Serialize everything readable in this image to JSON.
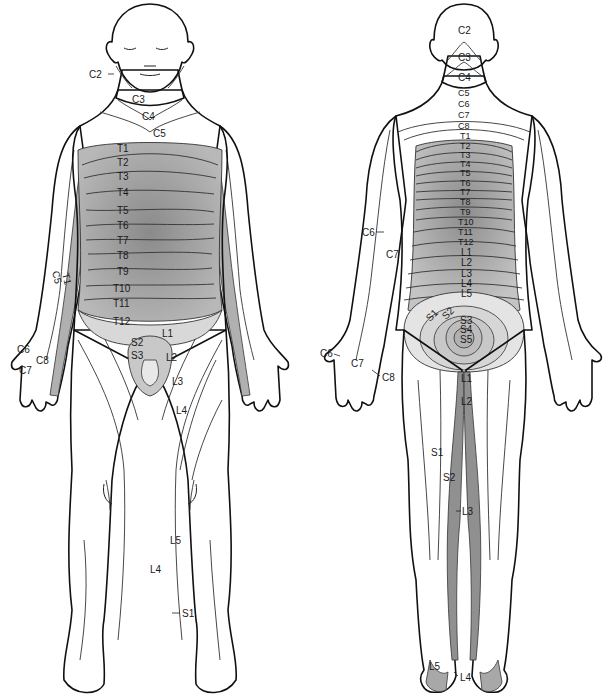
{
  "diagram": {
    "type": "dermatome-map",
    "views": [
      {
        "id": "anterior",
        "labels": {
          "c2": "C2",
          "c3": "C3",
          "c4": "C4",
          "c5": "C5",
          "t1": "T1",
          "t2": "T2",
          "t3": "T3",
          "t4": "T4",
          "t5": "T5",
          "t6": "T6",
          "t7": "T7",
          "t8": "T8",
          "t9": "T9",
          "t10": "T10",
          "t11": "T11",
          "t12": "T12",
          "arm_c5": "C5",
          "arm_t1": "T1",
          "c6": "C6",
          "c7": "C7",
          "c8": "C8",
          "s2": "S2",
          "s3": "S3",
          "l1": "L1",
          "l2": "L2",
          "l3": "L3",
          "l4": "L4",
          "leg_l5": "L5",
          "leg_l4": "L4",
          "s1": "S1"
        }
      },
      {
        "id": "posterior",
        "labels": {
          "c2": "C2",
          "c3": "C3",
          "c4": "C4",
          "c5": "C5",
          "c6": "C6",
          "c7": "C7",
          "c8": "C8",
          "t1": "T1",
          "t2": "T2",
          "t3": "T3",
          "t4": "T4",
          "t5": "T5",
          "t6": "T6",
          "t7": "T7",
          "t8": "T8",
          "t9": "T9",
          "t10": "T10",
          "t11": "T11",
          "t12": "T12",
          "l1": "L1",
          "l2": "L2",
          "l3": "L3",
          "l4": "L4",
          "l5": "L5",
          "s1": "S1",
          "s2": "S2",
          "s3": "S3",
          "s4": "S4",
          "s5": "S5",
          "arm_c6": "C6",
          "arm_c7": "C7",
          "hand_c6": "C6",
          "hand_c7": "C7",
          "hand_c8": "C8",
          "leg_l1": "L1",
          "leg_l2": "L2",
          "leg_s1": "S1",
          "leg_s2": "S2",
          "leg_l3": "L3",
          "foot_l5": "L5",
          "foot_l4": "L4"
        }
      }
    ],
    "colors": {
      "light": "#f2f2f2",
      "mid": "#cfcfcf",
      "dark": "#9a9a9a",
      "darker": "#7f7f7f",
      "outline": "#111111"
    }
  }
}
